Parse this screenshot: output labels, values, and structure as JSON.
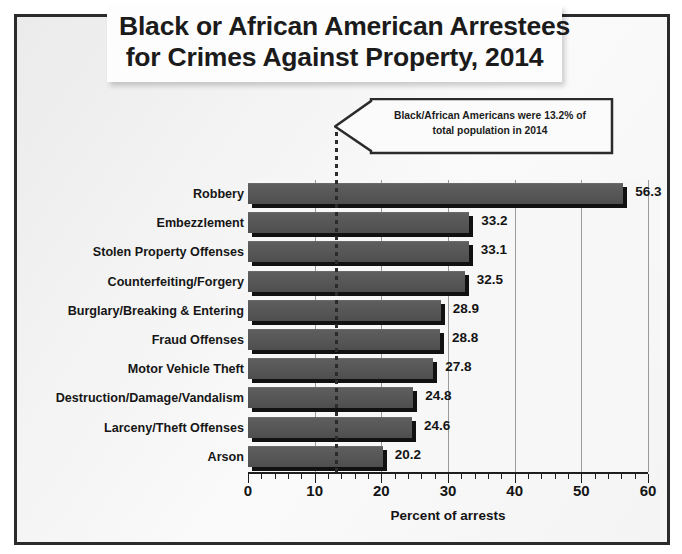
{
  "title": {
    "line1": "Black or African American Arrestees",
    "line2": "for Crimes Against Property, 2014"
  },
  "callout": {
    "line1": "Black/African Americans were 13.2% of",
    "line2": "total population in 2014"
  },
  "colors": {
    "bar_fill": "#565656",
    "bar_shadow": "#111111",
    "frame": "#2b2b2b",
    "refline": "#2b2b2b",
    "gridline": "#9a9a9a",
    "plot_bg": "#f7f7f7",
    "text": "#141414"
  },
  "chart_data": {
    "type": "bar",
    "orientation": "horizontal",
    "title": "Black or African American Arrestees for Crimes Against Property, 2014",
    "xlabel": "Percent of arrests",
    "ylabel": "",
    "xlim": [
      0,
      60
    ],
    "xticks": [
      0,
      10,
      20,
      30,
      40,
      50,
      60
    ],
    "xtick_labels": [
      "0",
      "10",
      "20",
      "30",
      "40",
      "50",
      "60"
    ],
    "minor_tick_interval": 2,
    "grid": "vertical-major",
    "legend": "none",
    "categories": [
      "Robbery",
      "Embezzlement",
      "Stolen Property Offenses",
      "Counterfeiting/Forgery",
      "Burglary/Breaking & Entering",
      "Fraud Offenses",
      "Motor Vehicle Theft",
      "Destruction/Damage/Vandalism",
      "Larceny/Theft Offenses",
      "Arson"
    ],
    "values": [
      56.3,
      33.2,
      33.1,
      32.5,
      28.9,
      28.8,
      27.8,
      24.8,
      24.6,
      20.2
    ],
    "value_labels": [
      "56.3",
      "33.2",
      "33.1",
      "32.5",
      "28.9",
      "28.8",
      "27.8",
      "24.8",
      "24.6",
      "20.2"
    ],
    "reference_line": {
      "value": 13.2,
      "style": "dotted",
      "label": "Black/African Americans were 13.2% of total population in 2014"
    }
  }
}
